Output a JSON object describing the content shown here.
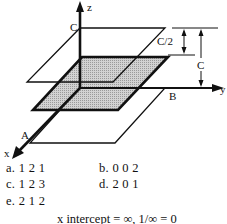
{
  "diagram": {
    "axes": {
      "z_label": "z",
      "y_label": "y",
      "x_label": "x"
    },
    "points": {
      "A": "A",
      "B": "B",
      "C": "C"
    },
    "dimensions": {
      "half_c": "C/2",
      "full_c": "C"
    },
    "planes": [
      {
        "name": "top-plane",
        "height": "C",
        "fill": "none"
      },
      {
        "name": "shaded-plane",
        "height": "C/2",
        "fill": "#c8c8c8"
      },
      {
        "name": "bottom-plane",
        "height": "0",
        "fill": "none"
      }
    ]
  },
  "choices": [
    {
      "key": "a",
      "label": "a. 1 2 1"
    },
    {
      "key": "b",
      "label": "b. 0 0 2"
    },
    {
      "key": "c",
      "label": "c. 1 2 3"
    },
    {
      "key": "d",
      "label": "d. 2 0 1"
    },
    {
      "key": "e",
      "label": "e. 2 1 2"
    }
  ],
  "note": "x intercept = ∞, 1/∞ = 0"
}
